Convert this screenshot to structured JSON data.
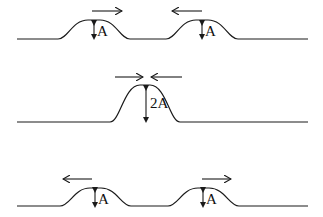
{
  "diagram": {
    "stages": [
      {
        "id": "before",
        "description": "Two pulses approaching each other",
        "pulses": [
          {
            "amplitude_label": "A",
            "direction": "right"
          },
          {
            "amplitude_label": "A",
            "direction": "left"
          }
        ]
      },
      {
        "id": "overlap",
        "description": "Pulses overlap constructively",
        "pulses": [
          {
            "amplitude_label": "2A",
            "direction": "both-inward"
          }
        ]
      },
      {
        "id": "after",
        "description": "Pulses moving apart",
        "pulses": [
          {
            "amplitude_label": "A",
            "direction": "left"
          },
          {
            "amplitude_label": "A",
            "direction": "right"
          }
        ]
      }
    ],
    "colors": {
      "line": "#1a1a1a",
      "background": "#ffffff"
    }
  }
}
